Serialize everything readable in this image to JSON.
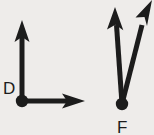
{
  "figure": {
    "type": "geometry-angle-diagram",
    "background_color": "#eeecea",
    "stroke_color": "#1c1c1c",
    "label_color": "#1c1c1c",
    "angles": [
      {
        "name": "angle-d",
        "vertex_label": "D",
        "vertex_label_position": "left-of-vertex",
        "vertex": {
          "x": 22,
          "y": 101
        },
        "vertex_dot_radius": 6,
        "angle_type": "right",
        "angle_measure_degrees": 90,
        "rays": [
          {
            "name": "ray-d-up",
            "direction": "up",
            "tip": {
              "x": 22,
              "y": 22
            },
            "arrowhead": true
          },
          {
            "name": "ray-d-right",
            "direction": "right",
            "tip": {
              "x": 84,
              "y": 101
            },
            "arrowhead": true
          }
        ]
      },
      {
        "name": "angle-f",
        "vertex_label": "F",
        "vertex_label_position": "below-vertex",
        "vertex": {
          "x": 122,
          "y": 104
        },
        "vertex_dot_radius": 6,
        "angle_type": "acute",
        "angle_measure_degrees": 22,
        "rays": [
          {
            "name": "ray-f-left",
            "direction": "up-slightly-left",
            "tip": {
              "x": 115,
              "y": 9
            },
            "arrowhead": true
          },
          {
            "name": "ray-f-right",
            "direction": "up-right",
            "tip": {
              "x": 151,
              "y": 2
            },
            "arrowhead": true,
            "clipped_at_edge": true
          }
        ]
      }
    ]
  }
}
